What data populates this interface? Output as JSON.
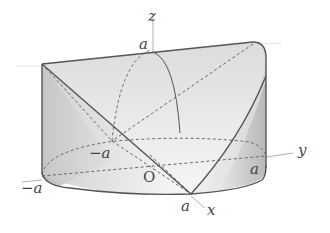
{
  "figure": {
    "colors": {
      "background": "#ffffff",
      "outline": "#555555",
      "dashed": "#666666",
      "axis": "#888888",
      "fill_dark": "#bdbdbd",
      "fill_light": "#ececec"
    }
  },
  "axes": {
    "x": {
      "label": "x"
    },
    "y": {
      "label": "y"
    },
    "z": {
      "label": "z"
    }
  },
  "labels": {
    "z_top": "a",
    "origin": "O",
    "neg_a_inner": "−a",
    "neg_a_outer": "−a",
    "a_y": "a",
    "a_x": "a"
  }
}
